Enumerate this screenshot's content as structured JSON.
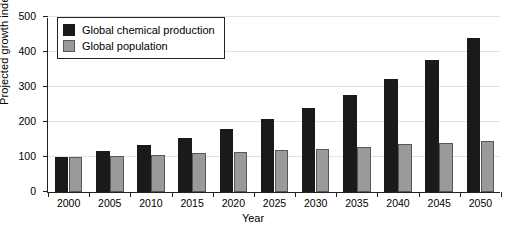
{
  "chart_data": {
    "type": "bar",
    "title": "",
    "xlabel": "Year",
    "ylabel": "Projected growth index",
    "categories": [
      "2000",
      "2005",
      "2010",
      "2015",
      "2020",
      "2025",
      "2030",
      "2035",
      "2040",
      "2045",
      "2050"
    ],
    "series": [
      {
        "name": "Global chemical production",
        "color": "#1a1a1a",
        "values": [
          100,
          118,
          133,
          155,
          180,
          208,
          240,
          277,
          323,
          378,
          440
        ]
      },
      {
        "name": "Global population",
        "color": "#9a9a9a",
        "values": [
          100,
          103,
          107,
          111,
          115,
          120,
          124,
          130,
          136,
          141,
          145
        ]
      }
    ],
    "ylim": [
      0,
      500
    ],
    "yticks": [
      0,
      100,
      200,
      300,
      400,
      500
    ],
    "ytick_labels": [
      "0",
      "100",
      "200",
      "300",
      "400",
      "500"
    ],
    "grid": "horizontal",
    "legend_position": "top-left"
  },
  "legend": {
    "items": [
      {
        "label": "Global chemical production"
      },
      {
        "label": "Global population"
      }
    ]
  }
}
